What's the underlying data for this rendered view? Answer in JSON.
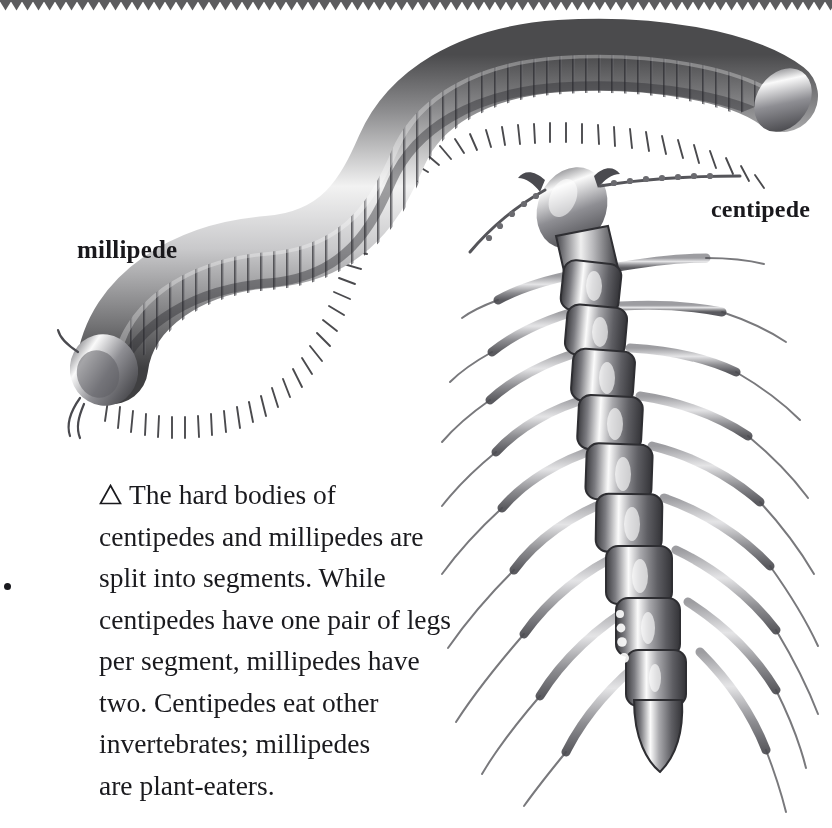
{
  "page": {
    "background_color": "#ffffff",
    "ink_color": "#1a1a1e",
    "width": 832,
    "height": 828
  },
  "decoration": {
    "top_edge": {
      "name": "scalloped-top-border",
      "color": "#5c5c5e",
      "tooth_width": 11,
      "tooth_height": 10
    }
  },
  "labels": {
    "millipede": "millipede",
    "centipede": "centipede"
  },
  "caption": {
    "marker": "△",
    "marker_name": "triangle-up-marker",
    "lines": [
      "The hard bodies of",
      "centipedes and millipedes are",
      "split into segments. While",
      "centipedes have one pair of legs",
      "per segment, millipedes have",
      "two. Centipedes eat other",
      "invertebrates; millipedes",
      "are plant-eaters."
    ],
    "full_text": "△ The hard bodies of centipedes and millipedes are split into segments. While centipedes have one pair of legs per segment, millipedes have two. Centipedes eat other invertebrates; millipedes are plant-eaters."
  },
  "illustrations": {
    "millipede": {
      "name": "millipede-illustration",
      "description": "Grayscale engraving of a millipede curved in an S shape across the upper portion of the page, head at lower left, many ring segments each with two pairs of short legs",
      "style": "pencil-engraving-grayscale"
    },
    "centipede": {
      "name": "centipede-illustration",
      "description": "Grayscale engraving of a centipede running vertically down the right side, head at top with long beaded antennae, body of flat plates each bearing one pair of long legs",
      "style": "pencil-engraving-grayscale"
    }
  }
}
